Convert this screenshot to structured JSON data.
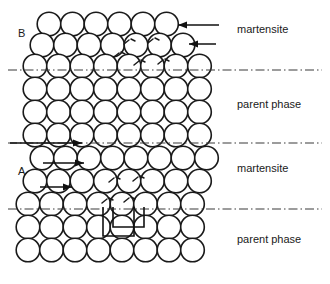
{
  "figure": {
    "width": 330,
    "height": 284,
    "background": "#ffffff",
    "atom_fill": "#ffffff",
    "atom_stroke": "#1a1a1a",
    "line_color": "#3a3a3a",
    "arrow_color": "#111111"
  },
  "region_labels": {
    "variant_b": "B",
    "variant_a": "A"
  },
  "phase_labels": [
    {
      "text": "martensite",
      "x": 237,
      "y": 33
    },
    {
      "text": "parent phase",
      "x": 237,
      "y": 108
    },
    {
      "text": "martensite",
      "x": 237,
      "y": 172
    },
    {
      "text": "parent phase",
      "x": 237,
      "y": 243
    }
  ],
  "interface_lines": [
    {
      "name": "interface-b-top",
      "y": 70,
      "x1": 8,
      "x2": 322
    },
    {
      "name": "interface-b-bottom",
      "y": 143,
      "x1": 8,
      "x2": 322
    },
    {
      "name": "interface-a-bottom",
      "y": 209,
      "x1": 8,
      "x2": 322
    }
  ],
  "shear_arrows": [
    {
      "name": "shear-arrow-b-1",
      "direction": "left",
      "x_tail": 219,
      "x_head": 178,
      "y": 25
    },
    {
      "name": "shear-arrow-b-2",
      "direction": "left",
      "x_tail": 216,
      "x_head": 189,
      "y": 44
    },
    {
      "name": "shear-arrow-mid",
      "direction": "right",
      "x_tail": 10,
      "x_head": 82,
      "y": 143
    },
    {
      "name": "shear-arrow-a-1",
      "direction": "right",
      "x_tail": 43,
      "x_head": 84,
      "y": 163
    },
    {
      "name": "shear-arrow-a-2",
      "direction": "right",
      "x_tail": 40,
      "x_head": 72,
      "y": 187
    }
  ],
  "unit_cell": {
    "name": "unit-cell-outline",
    "x": 103,
    "y": 207,
    "width": 31,
    "height": 29,
    "offset_x": 10,
    "offset_y": 9
  },
  "lattice": {
    "radius": 11.8,
    "rows": [
      {
        "name": "row-b-1",
        "phase": "martensite",
        "y": 24,
        "x_start": 49,
        "count": 6,
        "spacing": 23.5,
        "shift": 0.0
      },
      {
        "name": "row-b-2",
        "phase": "martensite",
        "y": 45,
        "x_start": 42,
        "count": 7,
        "spacing": 23.5,
        "shift": 0.0
      },
      {
        "name": "row-b-3",
        "phase": "martensite",
        "y": 66,
        "x_start": 35,
        "count": 8,
        "spacing": 23.5,
        "shift": 0.0
      },
      {
        "name": "row-p1-1",
        "phase": "parent",
        "y": 89,
        "x_start": 35,
        "count": 8,
        "spacing": 23.5,
        "shift": 0.0
      },
      {
        "name": "row-p1-2",
        "phase": "parent",
        "y": 112,
        "x_start": 35,
        "count": 8,
        "spacing": 23.5,
        "shift": 0.0
      },
      {
        "name": "row-p1-3",
        "phase": "parent",
        "y": 135,
        "x_start": 35,
        "count": 8,
        "spacing": 23.5,
        "shift": 0.0
      },
      {
        "name": "row-a-1",
        "phase": "martensite",
        "y": 158,
        "x_start": 42,
        "count": 8,
        "spacing": 23.5,
        "shift": 0.0
      },
      {
        "name": "row-a-2",
        "phase": "martensite",
        "y": 181,
        "x_start": 35,
        "count": 8,
        "spacing": 23.5,
        "shift": 0.0
      },
      {
        "name": "row-a-3",
        "phase": "martensite",
        "y": 204,
        "x_start": 28,
        "count": 8,
        "spacing": 23.5,
        "shift": 0.0
      },
      {
        "name": "row-p2-1",
        "phase": "parent",
        "y": 227,
        "x_start": 28,
        "count": 8,
        "spacing": 23.5,
        "shift": 0.0
      },
      {
        "name": "row-p2-2",
        "phase": "parent",
        "y": 250,
        "x_start": 28,
        "count": 8,
        "spacing": 23.5,
        "shift": 0.0
      }
    ]
  },
  "atom_markers": [
    {
      "name": "atom-marker",
      "x": 128,
      "y": 42
    },
    {
      "name": "atom-marker",
      "x": 152,
      "y": 41
    },
    {
      "name": "atom-marker",
      "x": 118,
      "y": 55
    },
    {
      "name": "atom-marker",
      "x": 138,
      "y": 63
    },
    {
      "name": "atom-marker",
      "x": 162,
      "y": 62
    },
    {
      "name": "atom-marker",
      "x": 113,
      "y": 180
    },
    {
      "name": "atom-marker",
      "x": 137,
      "y": 179
    },
    {
      "name": "atom-marker",
      "x": 106,
      "y": 201
    },
    {
      "name": "atom-marker",
      "x": 128,
      "y": 200
    }
  ]
}
